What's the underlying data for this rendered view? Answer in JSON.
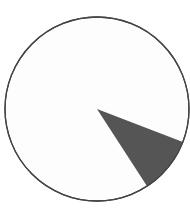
{
  "chart_data": {
    "type": "pie",
    "title": "",
    "categories": [
      "Remainder",
      "Highlighted slice"
    ],
    "values": [
      90,
      10
    ],
    "colors": [
      "#fdfdfd",
      "#555555"
    ],
    "outline_color": "#444444",
    "slice_start_angle_deg": 21,
    "slice_end_angle_deg": 57,
    "legend": "none"
  }
}
